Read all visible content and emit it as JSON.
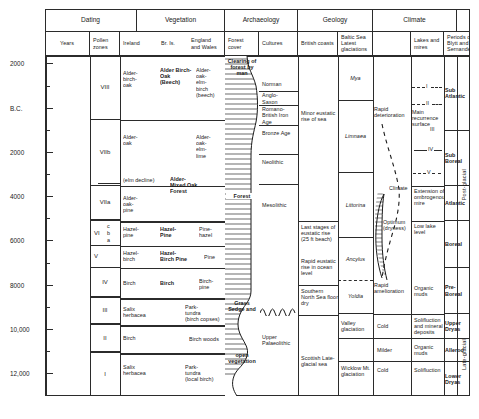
{
  "header": {
    "groups": [
      {
        "label": "Dating"
      },
      {
        "label": "Vegetation"
      },
      {
        "label": "Archaeology"
      },
      {
        "label": "Geology"
      },
      {
        "label": "Climate"
      },
      {
        "label": ""
      }
    ],
    "subheads": [
      {
        "label": "Years"
      },
      {
        "label": "Pollen zones"
      },
      {
        "label": "Ireland"
      },
      {
        "label": "Br. Is."
      },
      {
        "label": "England and Wales"
      },
      {
        "label": "Forest cover"
      },
      {
        "label": "Cultures"
      },
      {
        "label": "British coasts"
      },
      {
        "label": "Baltic Sea Latest glaciations"
      },
      {
        "label": ""
      },
      {
        "label": "Lakes and mires"
      },
      {
        "label": "Periods of Blytt and Sernander"
      },
      {
        "label": ""
      }
    ]
  },
  "axis": {
    "labels": [
      "2000",
      "B.C.",
      "2000",
      "4000",
      "6000",
      "8000",
      "10,000",
      "12,000"
    ],
    "unit": "Years"
  },
  "pollen_zones": [
    {
      "label": "VIII",
      "sub": []
    },
    {
      "label": "VIIb",
      "sub": []
    },
    {
      "label": "VIIa",
      "sub": []
    },
    {
      "label": "VI",
      "sub": [
        "c",
        "b",
        "a"
      ]
    },
    {
      "label": "V",
      "sub": []
    },
    {
      "label": "IV",
      "sub": []
    },
    {
      "label": "III",
      "sub": []
    },
    {
      "label": "II",
      "sub": []
    },
    {
      "label": "I",
      "sub": []
    }
  ],
  "vegetation": {
    "ireland": [
      "Alder-birch-oak",
      "Alder-oak",
      "(elm decline)",
      "Alder-oak-pine",
      "Hazel-pine",
      "Hazel-birch",
      "Birch",
      "Salix herbacea",
      "Birch",
      "Salix herbacea"
    ],
    "british_isles": [
      "Alder Birch-Oak (Beech)",
      "Alder-Mixed Oak Forest",
      "Hazel-Pine",
      "Hazel-Birch Pine",
      "Birch"
    ],
    "england_wales": [
      "Alder-oak-elm-birch (beech)",
      "Alder-oak-elm-lime",
      "Pine-hazel",
      "Pine",
      "Birch-pine",
      "Park-tundra (birch copses)",
      "Birch woods",
      "Park-tundra (local birch)"
    ]
  },
  "forest_cover": {
    "top_label": "Clearing of forest by man",
    "mid_label": "Forest",
    "lower_label": "Grass Sedge and",
    "bottom_label": "open vegetation"
  },
  "cultures": [
    "Norman",
    "Anglo-Saxon",
    "Romano-British Iron Age",
    "Bronze Age",
    "Neolithic",
    "Mesolithic",
    "Upper Palaeolithic"
  ],
  "geology": {
    "british_coasts": [
      "Minor eustatic rise of sea",
      "Last stages of eustatic rise (25 ft beach)",
      "Rapid eustatic rise in ocean level",
      "Southern North Sea floor dry",
      "Scottish Late-glacial sea"
    ],
    "baltic_sea": [
      "Mya",
      "Limnaea",
      "Littorina",
      "Ancylus",
      "Yoldia",
      "Valley glaciation",
      "Wicklow Mt. glaciation"
    ]
  },
  "climate": {
    "curve_labels": [
      "Rapid deterioration",
      "Climate",
      "Optimum (dryness)",
      "Rapid amelioration",
      "Cold",
      "Milder",
      "Cold"
    ],
    "lakes_and_mires": [
      "I",
      "II",
      "Main recurrence surface",
      "III",
      "IV",
      "V",
      "Extension of ombrogenous mire",
      "Low lake level",
      "Organic muds",
      "Solifluction and mineral deposits",
      "Organic muds",
      "Solifluction"
    ],
    "blytt_sernander": [
      "Sub Atlantic",
      "Sub Boreal",
      "Atlantic",
      "Boreal",
      "Pre-Boreal",
      "Upper Dryas",
      "Allerod",
      "Lower Dryas"
    ]
  },
  "stages": [
    {
      "label": "Post-glacial"
    },
    {
      "label": "Late-glacial"
    }
  ]
}
